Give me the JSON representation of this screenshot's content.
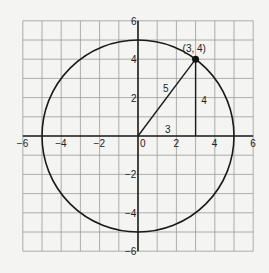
{
  "diagram": {
    "type": "coordinate-plane-circle",
    "grid": {
      "xmin": -6,
      "xmax": 6,
      "ymin": -6,
      "ymax": 6,
      "step": 1
    },
    "x_tick_labels": [
      "-6",
      "-4",
      "-2",
      "0",
      "2",
      "4",
      "6"
    ],
    "y_tick_labels": [
      "6",
      "4",
      "2",
      "-2",
      "-4",
      "-6"
    ],
    "circle": {
      "center": [
        0,
        0
      ],
      "radius": 5
    },
    "point": {
      "x": 3,
      "y": 4,
      "label": "(3, 4)"
    },
    "triangle_labels": {
      "hypotenuse": "5",
      "vertical_leg": "4",
      "horizontal_leg": "3"
    },
    "colors": {
      "grid": "#8a8a8a",
      "axis": "#222222",
      "curve": "#1a1a1a",
      "background": "#f4f4f2"
    }
  }
}
